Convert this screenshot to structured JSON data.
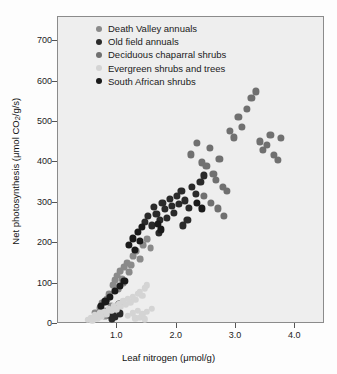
{
  "chart_data": {
    "type": "scatter",
    "title": "",
    "xlabel": "Leaf nitrogen (μmol/g)",
    "ylabel": "Net photosynthesis (μmol CO2/g/s)",
    "ylabel_parts": {
      "pre": "Net photosynthesis (μmol CO",
      "sub": "2",
      "post": "/g/s)"
    },
    "xlabel_parts": {
      "pre": "Leaf nitrogen (",
      "mu": "μ",
      "post": "mol/g)"
    },
    "xlim": [
      0.0,
      4.5
    ],
    "ylim": [
      0,
      760
    ],
    "xticks": [
      1.0,
      2.0,
      3.0,
      4.0
    ],
    "xtick_labels": [
      "1.0",
      "2.0",
      "3.0",
      "4.0"
    ],
    "yticks": [
      0,
      100,
      200,
      300,
      400,
      500,
      600,
      700
    ],
    "ytick_labels": [
      "0",
      "100",
      "200",
      "300",
      "400",
      "500",
      "600",
      "700"
    ],
    "grid": false,
    "legend_position": "top-left-inside",
    "plot_bg": "#eeeeee",
    "series": [
      {
        "name": "Death Valley annuals",
        "color": "#8a8a8a",
        "radius": 3.4,
        "points": [
          [
            0.62,
            28
          ],
          [
            0.7,
            40
          ],
          [
            0.74,
            52
          ],
          [
            0.78,
            33
          ],
          [
            0.83,
            62
          ],
          [
            0.86,
            74
          ],
          [
            0.9,
            45
          ],
          [
            0.93,
            96
          ],
          [
            0.96,
            108
          ],
          [
            0.99,
            120
          ],
          [
            1.02,
            86
          ],
          [
            1.05,
            130
          ],
          [
            1.08,
            112
          ],
          [
            1.12,
            140
          ],
          [
            1.16,
            150
          ],
          [
            1.2,
            128
          ],
          [
            1.26,
            168
          ],
          [
            1.32,
            180
          ],
          [
            1.38,
            160
          ],
          [
            1.44,
            196
          ],
          [
            1.5,
            210
          ],
          [
            1.56,
            188
          ],
          [
            0.66,
            18
          ],
          [
            0.8,
            20
          ],
          [
            1.1,
            100
          ],
          [
            1.23,
            146
          ]
        ]
      },
      {
        "name": "Old field annuals",
        "color": "#2a2a2a",
        "radius": 3.6,
        "points": [
          [
            0.86,
            22
          ],
          [
            0.92,
            30
          ],
          [
            0.96,
            18
          ],
          [
            1.0,
            40
          ],
          [
            1.04,
            26
          ],
          [
            0.88,
            35
          ],
          [
            0.91,
            12
          ],
          [
            1.02,
            50
          ],
          [
            1.46,
            252
          ],
          [
            1.52,
            268
          ],
          [
            1.58,
            244
          ],
          [
            1.62,
            290
          ],
          [
            1.66,
            272
          ],
          [
            1.72,
            258
          ],
          [
            1.76,
            300
          ],
          [
            1.8,
            284
          ],
          [
            1.84,
            262
          ],
          [
            1.88,
            310
          ],
          [
            1.92,
            292
          ],
          [
            1.96,
            276
          ],
          [
            2.0,
            318
          ],
          [
            2.04,
            298
          ],
          [
            2.08,
            330
          ],
          [
            2.14,
            306
          ],
          [
            2.2,
            288
          ],
          [
            2.26,
            340
          ],
          [
            2.32,
            322
          ],
          [
            2.4,
            352
          ],
          [
            2.46,
            368
          ],
          [
            2.1,
            244
          ],
          [
            2.18,
            258
          ],
          [
            1.7,
            226
          ]
        ]
      },
      {
        "name": "Deciduous chaparral shrubs",
        "color": "#707070",
        "radius": 3.6,
        "points": [
          [
            2.24,
            420
          ],
          [
            2.34,
            448
          ],
          [
            2.42,
            400
          ],
          [
            2.5,
            392
          ],
          [
            2.56,
            436
          ],
          [
            2.62,
            372
          ],
          [
            2.66,
            356
          ],
          [
            2.72,
            408
          ],
          [
            2.78,
            340
          ],
          [
            2.84,
            330
          ],
          [
            2.9,
            478
          ],
          [
            2.96,
            462
          ],
          [
            3.04,
            512
          ],
          [
            3.1,
            488
          ],
          [
            3.18,
            532
          ],
          [
            3.26,
            560
          ],
          [
            3.34,
            576
          ],
          [
            3.4,
            452
          ],
          [
            3.46,
            430
          ],
          [
            3.52,
            444
          ],
          [
            3.58,
            468
          ],
          [
            3.64,
            418
          ],
          [
            3.7,
            406
          ],
          [
            3.76,
            460
          ],
          [
            2.46,
            318
          ],
          [
            2.58,
            300
          ],
          [
            2.7,
            286
          ],
          [
            2.8,
            268
          ]
        ]
      },
      {
        "name": "Evergreen shrubs and trees",
        "color": "#d4d4d4",
        "radius": 3.2,
        "points": [
          [
            0.5,
            10
          ],
          [
            0.55,
            16
          ],
          [
            0.58,
            8
          ],
          [
            0.62,
            22
          ],
          [
            0.66,
            14
          ],
          [
            0.7,
            26
          ],
          [
            0.74,
            18
          ],
          [
            0.78,
            30
          ],
          [
            0.82,
            24
          ],
          [
            0.86,
            38
          ],
          [
            0.9,
            32
          ],
          [
            0.94,
            44
          ],
          [
            0.98,
            36
          ],
          [
            1.02,
            50
          ],
          [
            1.06,
            42
          ],
          [
            1.1,
            56
          ],
          [
            1.14,
            48
          ],
          [
            1.18,
            62
          ],
          [
            1.22,
            54
          ],
          [
            1.26,
            68
          ],
          [
            1.3,
            60
          ],
          [
            1.34,
            74
          ],
          [
            1.38,
            80
          ],
          [
            1.42,
            70
          ],
          [
            1.46,
            88
          ],
          [
            1.5,
            96
          ],
          [
            1.18,
            20
          ],
          [
            1.26,
            26
          ],
          [
            1.34,
            32
          ],
          [
            1.42,
            24
          ],
          [
            1.5,
            30
          ],
          [
            1.58,
            38
          ],
          [
            1.3,
            14
          ],
          [
            1.38,
            16
          ],
          [
            1.46,
            12
          ]
        ]
      },
      {
        "name": "South African shrubs",
        "color": "#1a1a1a",
        "radius": 3.6,
        "points": [
          [
            1.2,
            196
          ],
          [
            1.26,
            212
          ],
          [
            1.3,
            184
          ],
          [
            1.34,
            228
          ],
          [
            1.38,
            206
          ],
          [
            1.42,
            240
          ],
          [
            0.72,
            44
          ],
          [
            0.8,
            56
          ],
          [
            0.88,
            68
          ],
          [
            0.96,
            82
          ],
          [
            1.04,
            94
          ],
          [
            1.12,
            106
          ],
          [
            2.34,
            300
          ],
          [
            2.42,
            286
          ],
          [
            1.68,
            248
          ],
          [
            1.74,
            234
          ]
        ]
      }
    ]
  },
  "legend": {
    "items": [
      {
        "label": "Death Valley annuals",
        "color": "#8a8a8a"
      },
      {
        "label": "Old field annuals",
        "color": "#2a2a2a"
      },
      {
        "label": "Deciduous chaparral shrubs",
        "color": "#707070"
      },
      {
        "label": "Evergreen shrubs and trees",
        "color": "#d4d4d4"
      },
      {
        "label": "South African shrubs",
        "color": "#1a1a1a"
      }
    ]
  }
}
